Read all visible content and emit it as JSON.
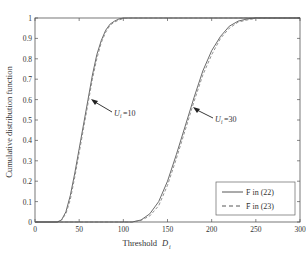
{
  "chart_data": {
    "type": "line",
    "title": "",
    "xlabel": "Threshold",
    "xlabel_symbol": "D",
    "xlabel_subscript": "i",
    "ylabel": "Cumulative distribution function",
    "xlim": [
      0,
      300
    ],
    "ylim": [
      0,
      1
    ],
    "grid": false,
    "legend_position": "lower right",
    "x_ticks": [
      0,
      50,
      100,
      150,
      200,
      250,
      300
    ],
    "y_ticks": [
      0,
      0.1,
      0.2,
      0.3,
      0.4,
      0.5,
      0.6,
      0.7,
      0.8,
      0.9,
      1
    ],
    "y_tick_labels": [
      "0",
      "0.1",
      "0.2",
      "0.3",
      "0.4",
      "0.5",
      "0.6",
      "0.7",
      "0.8",
      "0.9",
      "1"
    ],
    "legend": [
      {
        "label": "F in (22)",
        "style": "solid"
      },
      {
        "label": "F̄ in (23)",
        "style": "dashed"
      }
    ],
    "annotations": [
      {
        "text": "U_i=10",
        "label_main": "U",
        "label_sub": "i",
        "label_rest": "=10",
        "arrow_to": [
          58,
          0.6
        ]
      },
      {
        "text": "U_i=30",
        "label_main": "U",
        "label_sub": "i",
        "label_rest": "=30",
        "arrow_to": [
          172,
          0.55
        ]
      }
    ],
    "series": [
      {
        "name": "F in (22), U_i=10",
        "style": "solid",
        "x": [
          0,
          25,
          30,
          35,
          40,
          45,
          50,
          55,
          60,
          65,
          70,
          75,
          80,
          85,
          90,
          95,
          100,
          110,
          300
        ],
        "y": [
          0,
          0.0,
          0.01,
          0.05,
          0.13,
          0.24,
          0.36,
          0.48,
          0.6,
          0.72,
          0.82,
          0.89,
          0.94,
          0.97,
          0.985,
          0.995,
          1.0,
          1.0,
          1.0
        ]
      },
      {
        "name": "F̄ in (23), U_i=10",
        "style": "dashed",
        "x": [
          0,
          25,
          30,
          35,
          40,
          45,
          50,
          55,
          60,
          65,
          70,
          75,
          80,
          85,
          90,
          95,
          100,
          110,
          300
        ],
        "y": [
          0,
          0.0,
          0.01,
          0.04,
          0.11,
          0.22,
          0.34,
          0.46,
          0.58,
          0.7,
          0.8,
          0.88,
          0.93,
          0.965,
          0.98,
          0.99,
          0.997,
          1.0,
          1.0
        ]
      },
      {
        "name": "F in (22), U_i=30",
        "style": "solid",
        "x": [
          0,
          110,
          120,
          130,
          140,
          150,
          160,
          170,
          180,
          190,
          200,
          210,
          220,
          230,
          240,
          250,
          300
        ],
        "y": [
          0,
          0.0,
          0.01,
          0.04,
          0.1,
          0.2,
          0.33,
          0.47,
          0.61,
          0.74,
          0.84,
          0.91,
          0.96,
          0.985,
          0.995,
          1.0,
          1.0
        ]
      },
      {
        "name": "F̄ in (23), U_i=30",
        "style": "dashed",
        "x": [
          0,
          110,
          120,
          130,
          140,
          150,
          160,
          170,
          180,
          190,
          200,
          210,
          220,
          230,
          240,
          250,
          300
        ],
        "y": [
          0,
          0.0,
          0.008,
          0.03,
          0.08,
          0.18,
          0.31,
          0.45,
          0.59,
          0.72,
          0.82,
          0.9,
          0.95,
          0.98,
          0.99,
          0.998,
          1.0
        ]
      }
    ]
  },
  "colors": {
    "axis": "#555555",
    "line": "#444444",
    "text": "#333333"
  }
}
